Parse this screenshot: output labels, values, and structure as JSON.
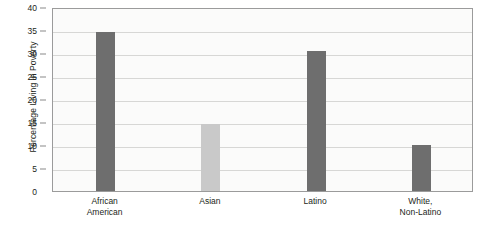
{
  "chart_data": {
    "type": "bar",
    "title": "",
    "xlabel": "",
    "ylabel": "Percentage Living in Poverty",
    "categories": [
      "African American",
      "Asian",
      "Latino",
      "White, Non-Latino"
    ],
    "category_lines": [
      [
        "African",
        "American"
      ],
      [
        "Asian",
        ""
      ],
      [
        "Latino",
        ""
      ],
      [
        "White,",
        "Non-Latino"
      ]
    ],
    "values": [
      34.5,
      14.5,
      30.5,
      10.0
    ],
    "bar_colors": [
      "#6e6e6e",
      "#c9c9c9",
      "#6e6e6e",
      "#6e6e6e"
    ],
    "ylim": [
      0,
      40
    ],
    "ytick_step": 5,
    "ytick_labels": [
      "0",
      "5",
      "10",
      "15",
      "20",
      "25",
      "30",
      "35",
      "40"
    ],
    "grid": true,
    "legend": "none",
    "plot_background": "#fbfbfa",
    "axis_color": "#9b9b9b",
    "gridline_color": "#d7d7d5"
  }
}
